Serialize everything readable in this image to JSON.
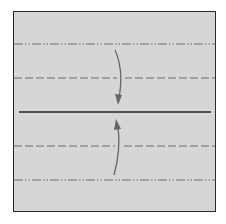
{
  "diagram": {
    "type": "origami-fold-diagram",
    "paper_color": "#d6d6d6",
    "border_color": "#2a2a2a",
    "line_color": "#6a6a6a",
    "center_line_color": "#222222",
    "arrow_color": "#666666",
    "lines": [
      {
        "kind": "mountain-fold",
        "y": 44,
        "style": "dash-dot-dot"
      },
      {
        "kind": "valley-fold",
        "y": 78,
        "style": "dashed"
      },
      {
        "kind": "center-crease",
        "y": 112,
        "style": "solid"
      },
      {
        "kind": "valley-fold",
        "y": 146,
        "style": "dashed"
      },
      {
        "kind": "mountain-fold",
        "y": 180,
        "style": "dash-dot-dot"
      }
    ],
    "arrows": [
      {
        "direction": "down",
        "from_y": 50,
        "to_y": 104,
        "label": "fold top edge to center"
      },
      {
        "direction": "up",
        "from_y": 174,
        "to_y": 120,
        "label": "fold bottom edge to center"
      }
    ]
  }
}
